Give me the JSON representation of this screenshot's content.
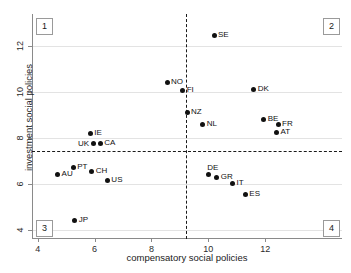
{
  "chart_data": {
    "type": "scatter",
    "title": "",
    "xlabel": "compensatory social policies",
    "ylabel": "investment social policies",
    "xlim": [
      3.8,
      14.7
    ],
    "ylim": [
      3.6,
      13.4
    ],
    "xticks": [
      4,
      6,
      8,
      10,
      12
    ],
    "yticks": [
      4,
      6,
      8,
      10,
      12
    ],
    "grid": "horizontal",
    "legend": "none",
    "reference_lines": {
      "vertical_x": 9.2,
      "horizontal_y": 7.45,
      "style": "dashed"
    },
    "quadrant_labels": [
      "1",
      "2",
      "3",
      "4"
    ],
    "points": [
      {
        "label": "SE",
        "x": 10.2,
        "y": 12.45,
        "label_pos": "right"
      },
      {
        "label": "NO",
        "x": 8.55,
        "y": 10.4,
        "label_pos": "right"
      },
      {
        "label": "FI",
        "x": 9.1,
        "y": 10.05,
        "label_pos": "right"
      },
      {
        "label": "DK",
        "x": 11.6,
        "y": 10.1,
        "label_pos": "right"
      },
      {
        "label": "NZ",
        "x": 9.25,
        "y": 9.1,
        "label_pos": "right"
      },
      {
        "label": "NL",
        "x": 9.8,
        "y": 8.6,
        "label_pos": "right"
      },
      {
        "label": "BE",
        "x": 11.95,
        "y": 8.8,
        "label_pos": "right"
      },
      {
        "label": "FR",
        "x": 12.45,
        "y": 8.6,
        "label_pos": "right"
      },
      {
        "label": "AT",
        "x": 12.4,
        "y": 8.25,
        "label_pos": "right"
      },
      {
        "label": "IE",
        "x": 5.85,
        "y": 8.2,
        "label_pos": "right"
      },
      {
        "label": "UK",
        "x": 5.95,
        "y": 7.75,
        "label_pos": "left"
      },
      {
        "label": "CA",
        "x": 6.2,
        "y": 7.75,
        "label_pos": "right"
      },
      {
        "label": "PT",
        "x": 5.25,
        "y": 6.7,
        "label_pos": "right"
      },
      {
        "label": "AU",
        "x": 4.7,
        "y": 6.4,
        "label_pos": "right"
      },
      {
        "label": "CH",
        "x": 5.9,
        "y": 6.55,
        "label_pos": "right"
      },
      {
        "label": "US",
        "x": 6.45,
        "y": 6.15,
        "label_pos": "right"
      },
      {
        "label": "DE",
        "x": 10.0,
        "y": 6.4,
        "label_pos": "above"
      },
      {
        "label": "GR",
        "x": 10.3,
        "y": 6.3,
        "label_pos": "right"
      },
      {
        "label": "IT",
        "x": 10.85,
        "y": 6.0,
        "label_pos": "right"
      },
      {
        "label": "ES",
        "x": 11.3,
        "y": 5.55,
        "label_pos": "right"
      },
      {
        "label": "JP",
        "x": 5.3,
        "y": 4.4,
        "label_pos": "right"
      }
    ]
  },
  "colors": {
    "marker": "#111111",
    "gridline": "#e3e3e3",
    "axis": "#8a8a8a",
    "refline": "#1a1a1a",
    "text": "#1a1a1a",
    "background": "#ffffff"
  }
}
